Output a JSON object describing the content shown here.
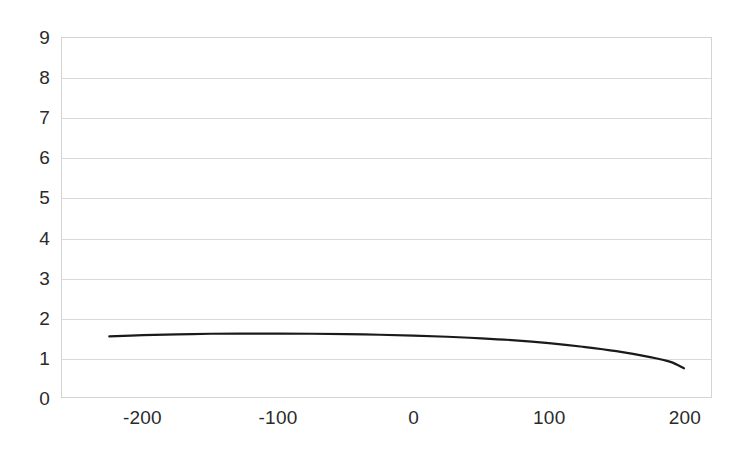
{
  "chart_data": {
    "type": "line",
    "title": "",
    "subtitle": "",
    "xlabel": "",
    "ylabel": "",
    "xlim": [
      -260,
      220
    ],
    "ylim": [
      0,
      9
    ],
    "grid": true,
    "legend": false,
    "legend_position": "none",
    "y_ticks": [
      9,
      8,
      7,
      6,
      5,
      4,
      3,
      2,
      1,
      0
    ],
    "y_tick_labels": [
      "9",
      "8",
      "7",
      "6",
      "5",
      "4",
      "3",
      "2",
      "1",
      "0"
    ],
    "x_ticks": [
      -200,
      -100,
      0,
      100,
      200
    ],
    "x_tick_labels": [
      "-200",
      "-100",
      "0",
      "100",
      "200"
    ],
    "series": [
      {
        "name": "series-1",
        "color": "#1a1a1a",
        "line_width": 2.2,
        "x": [
          -225,
          -200,
          -175,
          -150,
          -125,
          -100,
          -75,
          -50,
          -25,
          0,
          25,
          50,
          75,
          100,
          125,
          150,
          175,
          190,
          200
        ],
        "values": [
          1.52,
          1.55,
          1.57,
          1.585,
          1.59,
          1.59,
          1.585,
          1.575,
          1.56,
          1.54,
          1.51,
          1.47,
          1.42,
          1.35,
          1.26,
          1.15,
          1.0,
          0.88,
          0.72
        ]
      }
    ],
    "colors": {
      "plot_background": "#ffffff",
      "page_background": "#ffffff",
      "grid_line": "#d9d9d9",
      "plot_border": "#d4d4d4",
      "tick_label": "#2b2b2b",
      "series_line": "#1a1a1a"
    }
  }
}
